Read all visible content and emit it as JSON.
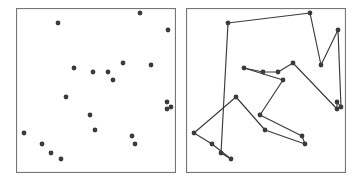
{
  "figure": {
    "width": 360,
    "height": 185,
    "background_color": "#ffffff"
  },
  "style": {
    "point_color": "#3b3b3b",
    "point_radius": 2.4,
    "edge_color": "#3a3a3a",
    "edge_width": 1.15,
    "frame_color": "#767676",
    "frame_width": 1.1,
    "panel_fill": "#ffffff"
  },
  "panels": [
    {
      "name": "points-panel",
      "label": "Points only",
      "x": 16,
      "y": 8,
      "width": 160,
      "height": 165,
      "show_edges": false
    },
    {
      "name": "tour-panel",
      "label": "Tour",
      "x": 186,
      "y": 8,
      "width": 160,
      "height": 165,
      "show_edges": true
    }
  ],
  "chart_data": {
    "type": "scatter",
    "subtitle": "",
    "xlabel": "",
    "ylabel": "",
    "xlim": [
      0,
      160
    ],
    "ylim": [
      0,
      165
    ],
    "grid": false,
    "legend": null,
    "n_points": 21,
    "points": [
      {
        "id": 0,
        "x": 124,
        "y": 5
      },
      {
        "id": 1,
        "x": 42,
        "y": 15
      },
      {
        "id": 2,
        "x": 152,
        "y": 22
      },
      {
        "id": 3,
        "x": 58,
        "y": 60
      },
      {
        "id": 4,
        "x": 77,
        "y": 64
      },
      {
        "id": 5,
        "x": 92,
        "y": 64
      },
      {
        "id": 6,
        "x": 107,
        "y": 55
      },
      {
        "id": 7,
        "x": 135,
        "y": 57
      },
      {
        "id": 8,
        "x": 97,
        "y": 72
      },
      {
        "id": 9,
        "x": 151,
        "y": 94
      },
      {
        "id": 10,
        "x": 151,
        "y": 101
      },
      {
        "id": 11,
        "x": 50,
        "y": 89
      },
      {
        "id": 12,
        "x": 74,
        "y": 107
      },
      {
        "id": 13,
        "x": 79,
        "y": 122
      },
      {
        "id": 14,
        "x": 8,
        "y": 125
      },
      {
        "id": 15,
        "x": 26,
        "y": 136
      },
      {
        "id": 16,
        "x": 35,
        "y": 145
      },
      {
        "id": 17,
        "x": 45,
        "y": 151
      },
      {
        "id": 18,
        "x": 116,
        "y": 128
      },
      {
        "id": 19,
        "x": 119,
        "y": 136
      },
      {
        "id": 20,
        "x": 155,
        "y": 99
      }
    ],
    "tour_order": [
      1,
      0,
      7,
      2,
      20,
      9,
      10,
      6,
      5,
      4,
      3,
      8,
      12,
      18,
      19,
      13,
      11,
      14,
      15,
      17,
      16,
      1
    ],
    "tour_edges": [
      {
        "from": 1,
        "to": 0
      },
      {
        "from": 0,
        "to": 7
      },
      {
        "from": 7,
        "to": 2
      },
      {
        "from": 2,
        "to": 20
      },
      {
        "from": 20,
        "to": 9
      },
      {
        "from": 9,
        "to": 10
      },
      {
        "from": 10,
        "to": 6
      },
      {
        "from": 6,
        "to": 5
      },
      {
        "from": 5,
        "to": 4
      },
      {
        "from": 4,
        "to": 3
      },
      {
        "from": 3,
        "to": 8
      },
      {
        "from": 8,
        "to": 12
      },
      {
        "from": 12,
        "to": 18
      },
      {
        "from": 18,
        "to": 19
      },
      {
        "from": 19,
        "to": 13
      },
      {
        "from": 13,
        "to": 11
      },
      {
        "from": 11,
        "to": 14
      },
      {
        "from": 14,
        "to": 15
      },
      {
        "from": 15,
        "to": 17
      },
      {
        "from": 17,
        "to": 16
      },
      {
        "from": 16,
        "to": 1
      }
    ]
  }
}
